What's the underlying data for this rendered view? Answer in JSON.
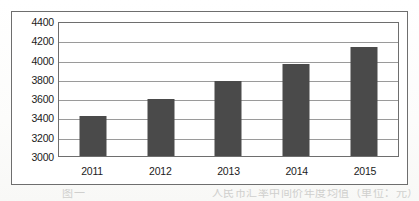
{
  "chart_data": {
    "type": "bar",
    "title": "",
    "xlabel": "",
    "ylabel": "",
    "categories": [
      "2011",
      "2012",
      "2013",
      "2014",
      "2015"
    ],
    "values": [
      3420,
      3600,
      3790,
      3970,
      4150
    ],
    "ylim": [
      3000,
      4400
    ],
    "ytick_step": 200,
    "yticks": [
      "4400",
      "4200",
      "4000",
      "3800",
      "3600",
      "3400",
      "3200",
      "3000"
    ],
    "ytick_values": [
      4400,
      4200,
      4000,
      3800,
      3600,
      3400,
      3200,
      3000
    ],
    "grid": true,
    "legend": false,
    "legend_position": "none",
    "series": [
      {
        "name": "",
        "values": [
          3420,
          3600,
          3790,
          3970,
          4150
        ],
        "color": "#4a4a4a"
      }
    ]
  },
  "figure": {
    "frame_color": "#6e6e6e",
    "plot_background": "#ffffff",
    "gridline_color": "#9a9a9a",
    "bar_color": "#4a4a4a",
    "tick_label_color": "#1b1b1b"
  },
  "caption": {
    "text": "图一　　　　　　　　　　　人民币汇率中间价年度均值（单位：元）"
  }
}
